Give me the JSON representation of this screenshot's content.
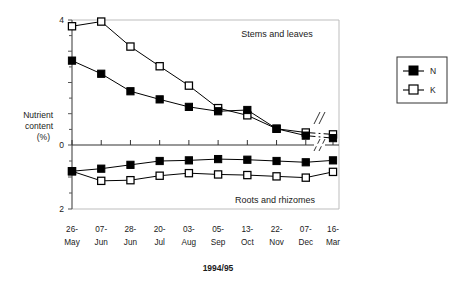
{
  "chart_data": {
    "type": "line",
    "title": "",
    "xlabel": "1994/95",
    "ylabel": "Nutrient content (%)",
    "ylabel_lines": [
      "Nutrient",
      "content",
      "(%)"
    ],
    "categories": [
      "26-May",
      "07-Jun",
      "28-Jun",
      "20-Jul",
      "03-Aug",
      "05-Sep",
      "13-Oct",
      "22-Nov",
      "07-Dec",
      "16-Mar"
    ],
    "categories_split": [
      {
        "day": "26-",
        "month": "May"
      },
      {
        "day": "07-",
        "month": "Jun"
      },
      {
        "day": "28-",
        "month": "Jun"
      },
      {
        "day": "20-",
        "month": "Jul"
      },
      {
        "day": "03-",
        "month": "Aug"
      },
      {
        "day": "05-",
        "month": "Sep"
      },
      {
        "day": "13-",
        "month": "Oct"
      },
      {
        "day": "22-",
        "month": "Nov"
      },
      {
        "day": "07-",
        "month": "Dec"
      },
      {
        "day": "16-",
        "month": "Mar"
      }
    ],
    "ylim_upper": [
      0,
      4
    ],
    "ylim_lower": [
      0,
      2
    ],
    "yticks_upper": [
      0,
      0.5,
      1,
      1.5,
      2,
      2.5,
      3,
      3.5,
      4
    ],
    "ytick_labels": [
      "4",
      "0",
      "2"
    ],
    "grid": false,
    "legend_position": "right",
    "axis_break_between": [
      "07-Dec",
      "16-Mar"
    ],
    "panels": [
      {
        "name": "Stems and leaves",
        "label": "Stems and leaves",
        "series": [
          {
            "name": "N",
            "marker": "filled-square",
            "values": [
              2.7,
              2.28,
              1.72,
              1.46,
              1.22,
              1.08,
              1.12,
              0.52,
              0.3,
              0.22
            ]
          },
          {
            "name": "K",
            "marker": "open-square",
            "values": [
              3.8,
              3.95,
              3.15,
              2.52,
              1.9,
              1.18,
              0.95,
              0.52,
              0.4,
              0.34
            ]
          }
        ]
      },
      {
        "name": "Roots and rhizomes",
        "label": "Roots and rhizomes",
        "series": [
          {
            "name": "N",
            "marker": "filled-square",
            "values": [
              0.82,
              0.74,
              0.62,
              0.5,
              0.48,
              0.44,
              0.46,
              0.5,
              0.54,
              0.48
            ]
          },
          {
            "name": "K",
            "marker": "open-square",
            "values": [
              0.82,
              1.12,
              1.1,
              0.96,
              0.88,
              0.92,
              0.94,
              0.98,
              1.02,
              0.84
            ]
          }
        ]
      }
    ],
    "legend": [
      {
        "label": "N",
        "marker": "filled-square"
      },
      {
        "label": "K",
        "marker": "open-square"
      }
    ],
    "colors": {
      "series_n": "#000000",
      "series_k": "#000000",
      "axis": "#555555",
      "grid": "#cccccc",
      "text": "#1a1a1a",
      "background": "#ffffff"
    }
  }
}
